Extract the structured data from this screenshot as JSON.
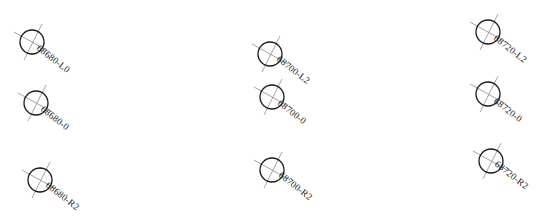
{
  "diagram": {
    "type": "survey-station-markers",
    "colors": {
      "circle": "#1a1a1a",
      "crosshair": "#8a8a8a",
      "label": "#222222",
      "background": "#ffffff"
    },
    "markers": [
      {
        "label": "68680-L0",
        "x": 32,
        "y": 42,
        "label_angle": 40
      },
      {
        "label": "68680-0",
        "x": 36,
        "y": 103,
        "label_angle": 40
      },
      {
        "label": "68680-R2",
        "x": 40,
        "y": 180,
        "label_angle": 38
      },
      {
        "label": "68700-L2",
        "x": 270,
        "y": 54,
        "label_angle": 38
      },
      {
        "label": "68700-0",
        "x": 272,
        "y": 97,
        "label_angle": 40
      },
      {
        "label": "68700-R2",
        "x": 272,
        "y": 170,
        "label_angle": 38
      },
      {
        "label": "68720-L2",
        "x": 488,
        "y": 32,
        "label_angle": 40
      },
      {
        "label": "68720-0",
        "x": 488,
        "y": 94,
        "label_angle": 40
      },
      {
        "label": "68720-R2",
        "x": 491,
        "y": 161,
        "label_angle": 40
      }
    ]
  }
}
